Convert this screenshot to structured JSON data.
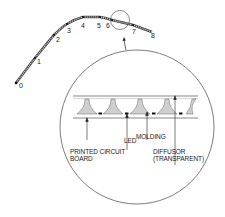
{
  "diagram": {
    "type": "technical-illustration",
    "path_points": [
      {
        "label": "0",
        "x": 16,
        "y": 83
      },
      {
        "label": "1",
        "x": 35,
        "y": 58
      },
      {
        "label": "2",
        "x": 54,
        "y": 35
      },
      {
        "label": "3",
        "x": 67,
        "y": 24
      },
      {
        "label": "4",
        "x": 83,
        "y": 17
      },
      {
        "label": "5",
        "x": 100,
        "y": 17
      },
      {
        "label": "6",
        "x": 112,
        "y": 20
      },
      {
        "label": "7",
        "x": 133,
        "y": 25
      },
      {
        "label": "8",
        "x": 152,
        "y": 32
      }
    ],
    "detail_labels": {
      "printed_circuit_board_line1": "PRINTED CIRCUIT",
      "printed_circuit_board_line2": "BOARD",
      "led": "LED",
      "molding": "MOLDING",
      "diffusor_line1": "DIFFUSOR",
      "diffusor_line2": "(TRANSPARENT)"
    },
    "colors": {
      "line": "#333333",
      "molding_fill": "#c8c8c8",
      "led_fill": "#111111"
    }
  }
}
